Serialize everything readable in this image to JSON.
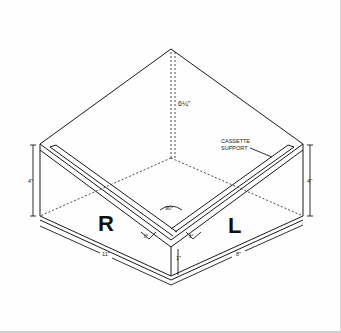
{
  "diagram": {
    "letters": {
      "right_side": "R",
      "left_side": "L"
    },
    "callout": {
      "line1": "CASSETTE",
      "line2": "SUPPORT"
    },
    "dimensions": {
      "apex_height": "6¼\"",
      "left_wall_height": "4\"",
      "right_wall_height": "4\"",
      "left_length": "11\"",
      "right_length": "8\"",
      "front_lip_height": "1\""
    },
    "angles": {
      "corner": "90°",
      "left_tilt": "8°",
      "right_tilt": "8°"
    },
    "colors": {
      "line": "#1a1a1a",
      "background": "#fefefe"
    }
  }
}
